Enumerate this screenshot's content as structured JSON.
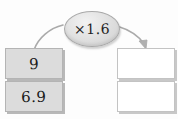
{
  "diagram": {
    "type": "function-machine",
    "title": "",
    "operator": {
      "label": "×1.6",
      "shape": "oval",
      "fill": "#e2e2e2",
      "stroke": "#a9a9a9"
    },
    "inputs": [
      {
        "value": "9",
        "filled": true,
        "fill": "#dcdcdc"
      },
      {
        "value": "6.9",
        "filled": true,
        "fill": "#dcdcdc"
      }
    ],
    "outputs": [
      {
        "value": "",
        "filled": false,
        "fill": "#ffffff"
      },
      {
        "value": "",
        "filled": false,
        "fill": "#ffffff"
      }
    ],
    "arrows": [
      {
        "name": "input-to-operator",
        "direction": "up-right",
        "head": false
      },
      {
        "name": "operator-to-output",
        "direction": "down-right",
        "head": true
      }
    ],
    "colors": {
      "background": "#fdfdfd",
      "input_box_fill": "#dcdcdc",
      "input_box_border": "#b4b4b4",
      "output_box_fill": "#ffffff",
      "output_box_border": "#c3c3c3",
      "arrow_stroke": "#a8a8a8",
      "text": "#1a1a1a"
    }
  }
}
